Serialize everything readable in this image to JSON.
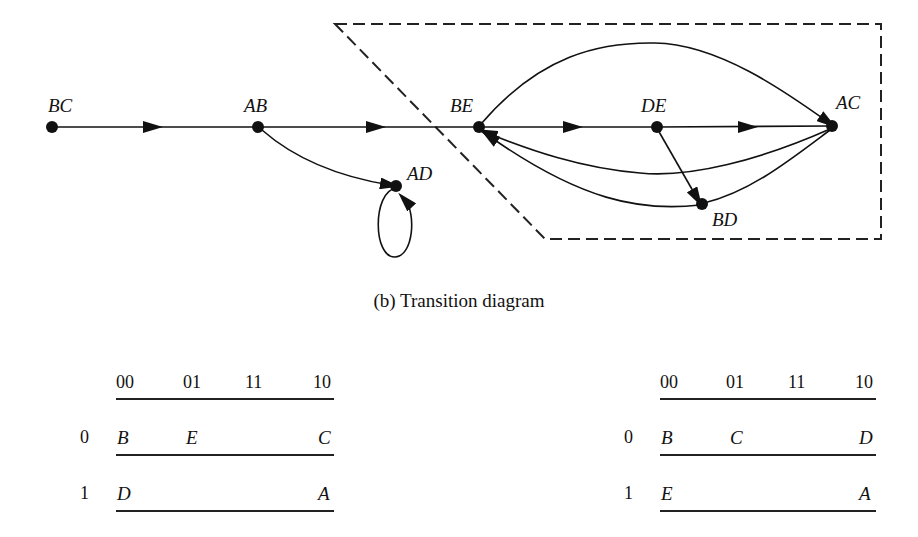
{
  "diagram": {
    "nodes": [
      {
        "id": "BC",
        "label": "BC",
        "x": 52,
        "y": 127
      },
      {
        "id": "AB",
        "label": "AB",
        "x": 258,
        "y": 127
      },
      {
        "id": "BE",
        "label": "BE",
        "x": 479,
        "y": 127
      },
      {
        "id": "DE",
        "label": "DE",
        "x": 657,
        "y": 127
      },
      {
        "id": "AC",
        "label": "AC",
        "x": 832,
        "y": 126
      },
      {
        "id": "AD",
        "label": "AD",
        "x": 396,
        "y": 186
      },
      {
        "id": "BD",
        "label": "BD",
        "x": 702,
        "y": 204
      }
    ],
    "edges": [
      {
        "from": "BC",
        "to": "AB"
      },
      {
        "from": "AB",
        "to": "BE"
      },
      {
        "from": "AB",
        "to": "AD"
      },
      {
        "from": "AD",
        "to": "AD"
      },
      {
        "from": "BE",
        "to": "DE"
      },
      {
        "from": "DE",
        "to": "AC"
      },
      {
        "from": "BE",
        "to": "AC"
      },
      {
        "from": "AC",
        "to": "BE"
      },
      {
        "from": "DE",
        "to": "BD"
      },
      {
        "from": "AC",
        "to": "BD"
      },
      {
        "from": "BD",
        "to": "BE"
      }
    ],
    "enclosure": "dashed region containing BE, DE, AC, BD"
  },
  "caption": "(b)  Transition diagram",
  "tables": [
    {
      "columns": [
        "00",
        "01",
        "11",
        "10"
      ],
      "rows": [
        {
          "label": "0",
          "cells": [
            "B",
            "E",
            "",
            "C"
          ]
        },
        {
          "label": "1",
          "cells": [
            "D",
            "",
            "",
            "A"
          ]
        }
      ]
    },
    {
      "columns": [
        "00",
        "01",
        "11",
        "10"
      ],
      "rows": [
        {
          "label": "0",
          "cells": [
            "B",
            "C",
            "",
            "D"
          ]
        },
        {
          "label": "1",
          "cells": [
            "E",
            "",
            "",
            "A"
          ]
        }
      ]
    }
  ]
}
